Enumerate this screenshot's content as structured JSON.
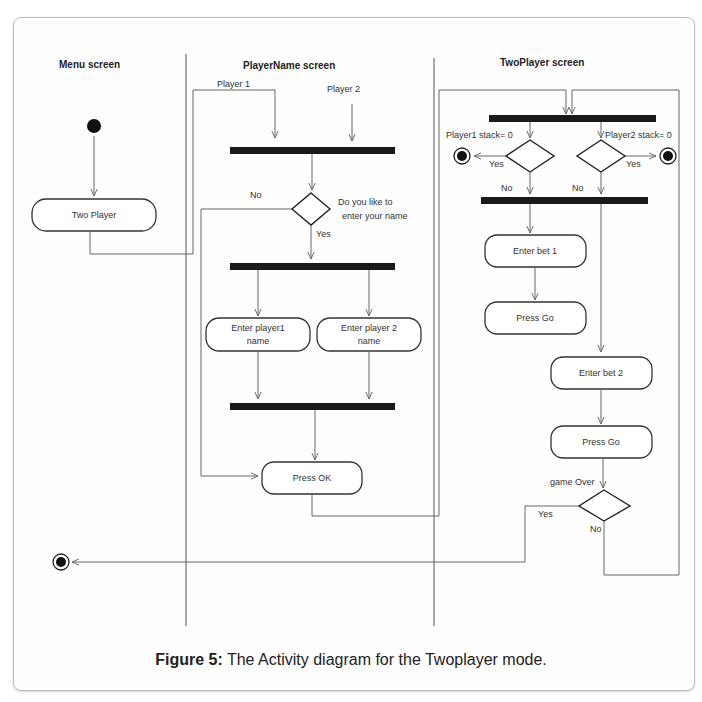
{
  "figure": {
    "caption_label": "Figure 5:",
    "caption_text": " The Activity diagram for the Twoplayer mode."
  },
  "lanes": [
    {
      "title": "Menu screen"
    },
    {
      "title": "PlayerName screen"
    },
    {
      "title": "TwoPlayer screen"
    }
  ],
  "menu": {
    "two_player": "Two Player"
  },
  "playername": {
    "player1_label": "Player 1",
    "player2_label": "Player 2",
    "decision_q1": "Do you like to",
    "decision_q2": "enter your name",
    "no_label": "No",
    "yes_label": "Yes",
    "enter_p1_line1": "Enter player1",
    "enter_p1_line2": "name",
    "enter_p2_line1": "Enter player 2",
    "enter_p2_line2": "name",
    "press_ok": "Press OK"
  },
  "twoplayer": {
    "p1_stack": "Player1 stack= 0",
    "p2_stack": "Player2 stack= 0",
    "yes1": "Yes",
    "yes2": "Yes",
    "no1": "No",
    "no2": "No",
    "enter_bet1": "Enter bet 1",
    "press_go1": "Press Go",
    "enter_bet2": "Enter bet 2",
    "press_go2": "Press Go",
    "game_over": "game Over",
    "go_yes": "Yes",
    "go_no": "No"
  }
}
